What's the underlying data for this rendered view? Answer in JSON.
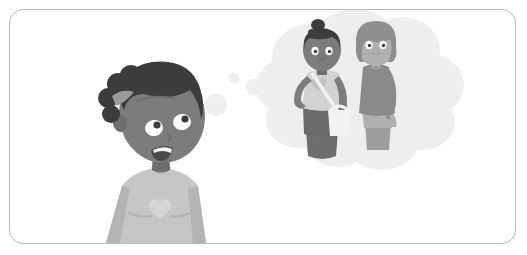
{
  "illustration": {
    "title": "Girl thinking about two friends",
    "description": "Grayscale cartoon illustration: a smiling girl at lower left looks up and to the right while a cloud-shaped thought bubble above her right shows two teenage friends standing together.",
    "style": "flat vector cartoon, monochrome grayscale",
    "frame": {
      "border_color": "#b9b9b9",
      "background_color": "#ffffff",
      "corner_radius_px": 14,
      "border_width_px": 1
    },
    "palette": {
      "background": "#ffffff",
      "frame_border": "#b9b9b9",
      "hair_dark": "#3c3c3c",
      "hair_mid": "#8e8e8e",
      "skin_dark": "#7c7c7c",
      "skin_dark_shadow": "#6e6e6e",
      "skin_light": "#b0b0b0",
      "skin_light_shadow": "#9d9d9d",
      "shirt_light": "#c6c6c6",
      "shirt_light_shadow": "#b4b4b4",
      "shirt_dark": "#8a8a8a",
      "skirt_dark": "#6a6a6a",
      "bag_white": "#f2f2f2",
      "bubble_fill": "#eeeeee",
      "eye_white": "#ffffff",
      "pupil": "#3c3c3c",
      "mouth_dark": "#4a4a4a",
      "tooth_white": "#f4f4f4"
    },
    "subjects": [
      {
        "name": "foreground-girl",
        "role": "main character, daydreaming",
        "position": "lower-left",
        "pose": "head tilted right, looking up-right, smiling with open mouth",
        "hair": "dark curly hair with side puff and light gray hair band",
        "clothing": "light gray short-sleeved t-shirt with a pale heart motif on the chest",
        "skin_tone": "dark",
        "cropped_at": "bottom edge of frame"
      },
      {
        "name": "bubble-girl-left",
        "role": "imagined friend",
        "position": "inside thought bubble, left",
        "pose": "standing, left hand on hip",
        "hair": "dark hair tied in a top bun",
        "clothing": "light sleeveless top with heart detail, dark skirt, white crossbody shoulder bag",
        "skin_tone": "dark"
      },
      {
        "name": "bubble-girl-right",
        "role": "imagined friend",
        "position": "inside thought bubble, right",
        "pose": "standing, leaning slightly left, arms at sides",
        "hair": "mid-gray chin-length bob with bangs",
        "clothing": "dark sleeveless top with light gray shorts",
        "skin_tone": "light"
      }
    ],
    "thought_bubble": {
      "shape": "cloud of overlapping circles",
      "fill_color": "#eeeeee",
      "trail_dots": 3,
      "trail_direction": "from bubble lower-left toward the girl's head"
    }
  }
}
